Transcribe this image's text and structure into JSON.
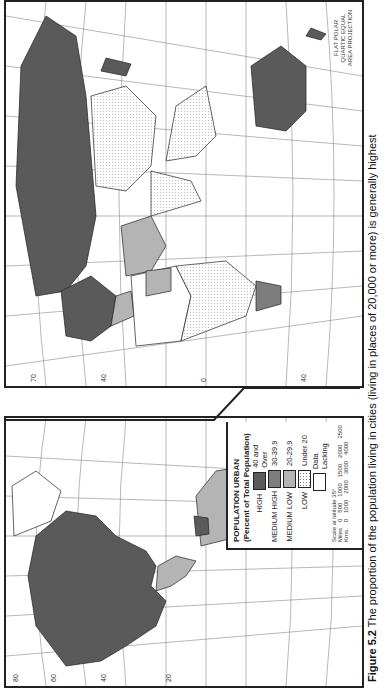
{
  "legend": {
    "title": "POPULATION URBAN",
    "subtitle": "(Percent of Total Population)",
    "items": [
      {
        "label": "HIGH",
        "range": "40 and Over",
        "color": "#5a5a5a"
      },
      {
        "label": "MEDIUM HIGH",
        "range": "30-39.9",
        "color": "#7d7d7d"
      },
      {
        "label": "MEDIUM LOW",
        "range": "20-29.9",
        "color": "#b4b4b4"
      },
      {
        "label": "LOW",
        "range": "Under 20",
        "color": "#ffffff"
      },
      {
        "label": "",
        "range": "Data Lacking",
        "color": "#ffffff"
      }
    ],
    "scale_title": "Scale at latitude 35°",
    "miles_label": "Miles",
    "miles_ticks": [
      "0",
      "500",
      "1000",
      "1500",
      "2000",
      "2500"
    ],
    "kms_label": "Kms.",
    "kms_ticks": [
      "0",
      "1000",
      "2000",
      "3000",
      "4000"
    ]
  },
  "projection": "FLAT POLAR QUARTIC EQUAL AREA PROJECTION",
  "caption": {
    "figure": "Figure 5.2",
    "text": "The proportion of the population living in cities (living in places of 20,000 or more) is generally highest"
  },
  "longitude_ticks": [
    "180",
    "160",
    "140",
    "120",
    "100",
    "80",
    "60",
    "40",
    "20",
    "0",
    "20",
    "40",
    "60",
    "80",
    "100",
    "120",
    "140",
    "160",
    "180"
  ],
  "latitude_ticks": [
    "80",
    "70",
    "60",
    "50",
    "40",
    "30",
    "20",
    "10",
    "0",
    "10",
    "20",
    "30",
    "40",
    "50",
    "60"
  ]
}
